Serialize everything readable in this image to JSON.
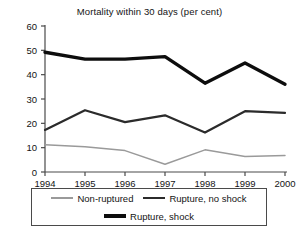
{
  "chart_data": {
    "type": "line",
    "title": "Mortality within 30 days (per cent)",
    "xlabel": "",
    "ylabel": "",
    "categories": [
      "1994",
      "1995",
      "1996",
      "1997",
      "1998",
      "1999",
      "2000"
    ],
    "x": [
      1994,
      1995,
      1996,
      1997,
      1998,
      1999,
      2000
    ],
    "xlim": [
      1994,
      2000
    ],
    "ylim": [
      0,
      60
    ],
    "yticks": [
      0,
      10,
      20,
      30,
      40,
      50,
      60
    ],
    "xticks": [
      "1994",
      "1995",
      "1996",
      "1997",
      "1998",
      "1999",
      "2000"
    ],
    "grid": false,
    "legend_position": "bottom",
    "series": [
      {
        "name": "Non-ruptured",
        "color": "#9a9a9a",
        "line_width": 1.5,
        "values": [
          11.2,
          10.4,
          8.8,
          3.2,
          9.1,
          6.4,
          6.8
        ]
      },
      {
        "name": "Rupture, no shock",
        "color": "#2b2b2b",
        "line_width": 2.2,
        "values": [
          17.3,
          25.4,
          20.5,
          23.3,
          16.2,
          25.0,
          24.3
        ]
      },
      {
        "name": "Rupture, shock",
        "color": "#0d0d0d",
        "line_width": 3.4,
        "values": [
          49.2,
          46.4,
          46.4,
          47.4,
          36.5,
          44.8,
          36.1
        ]
      }
    ]
  },
  "legend": {
    "items": [
      {
        "label": "Non-ruptured",
        "swatch": "thin"
      },
      {
        "label": "Rupture, no shock",
        "swatch": "medium"
      },
      {
        "label": "Rupture, shock",
        "swatch": "thick"
      }
    ]
  },
  "axis": {
    "y_labels": [
      "60",
      "50",
      "40",
      "30",
      "20",
      "10",
      "0"
    ],
    "x_labels": [
      "1994",
      "1995",
      "1996",
      "1997",
      "1998",
      "1999",
      "2000"
    ]
  }
}
